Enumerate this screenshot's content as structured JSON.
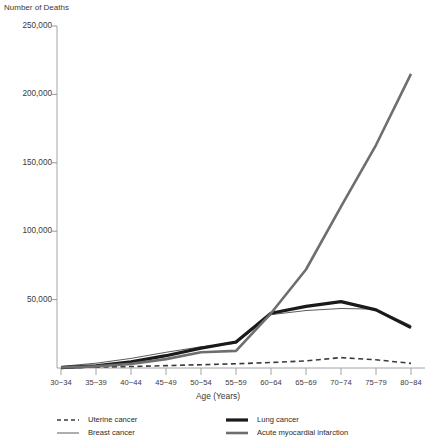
{
  "chart_data": {
    "type": "line",
    "title": "Number of Deaths",
    "xlabel": "Age (Years)",
    "ylabel": "Number of Deaths",
    "grid": false,
    "legend_position": "bottom",
    "ylim": [
      0,
      250000
    ],
    "yticks": [
      250000,
      200000,
      150000,
      100000,
      50000
    ],
    "ytick_labels": [
      "250,000",
      "200,000",
      "150,000",
      "100,000",
      "50,000"
    ],
    "categories": [
      "30−34",
      "35−39",
      "40−44",
      "45−49",
      "50−54",
      "55−59",
      "60−64",
      "65−69",
      "70−74",
      "75−79",
      "80−84"
    ],
    "series": [
      {
        "name": "Uterine cancer",
        "style": "dashed",
        "color": "#3b3b3b",
        "width": 1.6,
        "values": [
          300,
          600,
          1100,
          1700,
          2400,
          3100,
          4000,
          5200,
          7600,
          6000,
          3400
        ]
      },
      {
        "name": "Breast cancer",
        "style": "thin-solid",
        "color": "#4a4a4a",
        "width": 0.9,
        "values": [
          1200,
          3500,
          7000,
          11500,
          15500,
          18000,
          39000,
          42000,
          43500,
          43000,
          31000
        ]
      },
      {
        "name": "Lung cancer",
        "style": "thick-solid",
        "color": "#1a1a1a",
        "width": 3.2,
        "values": [
          300,
          1600,
          4500,
          9000,
          14500,
          19000,
          40000,
          45000,
          48500,
          42500,
          29500
        ]
      },
      {
        "name": "Acute myocardial infarction",
        "style": "medium-solid",
        "color": "#6e6e6e",
        "width": 2.6,
        "values": [
          400,
          1200,
          3000,
          6500,
          11500,
          12500,
          40000,
          72000,
          118000,
          163000,
          215000
        ]
      }
    ]
  },
  "legend": {
    "items": [
      {
        "label": "Uterine cancer",
        "swatch": "dashed-line-swatch"
      },
      {
        "label": "Breast cancer",
        "swatch": "thin-line-swatch"
      },
      {
        "label": "Lung cancer",
        "swatch": "thick-line-swatch"
      },
      {
        "label": "Acute myocardial infarction",
        "swatch": "medium-line-swatch"
      }
    ]
  }
}
